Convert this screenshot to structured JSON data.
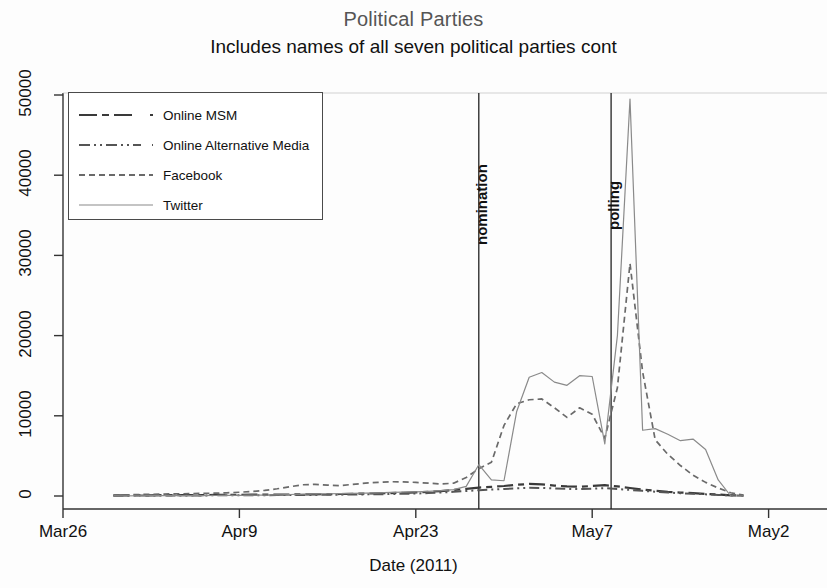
{
  "chart_data": {
    "type": "line",
    "title": "Political Parties",
    "subtitle": "Includes names of all seven political parties cont",
    "xlabel": "Date (2011)",
    "ylabel": "",
    "grid": false,
    "legend_position": "top-left",
    "xlim": [
      0,
      60
    ],
    "ylim": [
      0,
      50000
    ],
    "yticks": [
      "0",
      "10000",
      "20000",
      "30000",
      "40000",
      "50000"
    ],
    "ytick_values": [
      0,
      10000,
      20000,
      30000,
      40000,
      50000
    ],
    "xticks": [
      "Mar26",
      "Apr9",
      "Apr23",
      "May7",
      "May2"
    ],
    "xtick_values": [
      0,
      14,
      28,
      42,
      56
    ],
    "annotations": [
      {
        "label": "nomination",
        "x": 33
      },
      {
        "label": "polling",
        "x": 43.5
      }
    ],
    "x": [
      4,
      5,
      6,
      7,
      8,
      9,
      10,
      11,
      12,
      13,
      14,
      15,
      16,
      17,
      18,
      19,
      20,
      21,
      22,
      23,
      24,
      25,
      26,
      27,
      28,
      29,
      30,
      31,
      32,
      33,
      34,
      35,
      36,
      37,
      38,
      39,
      40,
      41,
      42,
      43,
      44,
      45,
      46,
      47,
      48,
      49,
      50,
      51,
      52,
      53,
      54
    ],
    "series": [
      {
        "name": "Online MSM",
        "style": "long-dash",
        "color": "#3a3a3a",
        "values": [
          60,
          70,
          80,
          90,
          100,
          110,
          110,
          120,
          130,
          140,
          150,
          160,
          170,
          180,
          190,
          200,
          210,
          230,
          250,
          270,
          300,
          330,
          360,
          400,
          450,
          520,
          620,
          760,
          900,
          1050,
          1150,
          1250,
          1400,
          1500,
          1450,
          1300,
          1200,
          1150,
          1250,
          1350,
          1200,
          1000,
          800,
          650,
          520,
          430,
          350,
          260,
          180,
          90,
          40
        ]
      },
      {
        "name": "Online Alternative Media",
        "style": "dash-dot-dot",
        "color": "#555555",
        "values": [
          40,
          45,
          50,
          55,
          60,
          65,
          70,
          75,
          80,
          85,
          90,
          95,
          100,
          110,
          120,
          130,
          140,
          155,
          170,
          185,
          200,
          220,
          245,
          275,
          310,
          360,
          430,
          520,
          620,
          720,
          800,
          880,
          960,
          1020,
          1000,
          940,
          890,
          860,
          920,
          980,
          880,
          760,
          640,
          530,
          430,
          350,
          280,
          210,
          140,
          70,
          30
        ]
      },
      {
        "name": "Facebook",
        "style": "short-dash",
        "color": "#6a6a6a",
        "values": [
          120,
          150,
          180,
          210,
          240,
          270,
          290,
          320,
          350,
          400,
          470,
          560,
          700,
          900,
          1150,
          1400,
          1450,
          1350,
          1300,
          1450,
          1600,
          1700,
          1780,
          1750,
          1700,
          1600,
          1500,
          1600,
          2300,
          3400,
          4200,
          8800,
          11500,
          12000,
          12100,
          11000,
          9800,
          11000,
          10200,
          7200,
          13500,
          29000,
          15500,
          7000,
          5200,
          3800,
          2600,
          1700,
          1000,
          400,
          100
        ]
      },
      {
        "name": "Twitter",
        "style": "solid-thin",
        "color": "#8a8a8a",
        "values": [
          20,
          25,
          30,
          35,
          40,
          45,
          50,
          55,
          60,
          70,
          85,
          100,
          120,
          150,
          190,
          230,
          260,
          280,
          300,
          330,
          360,
          400,
          440,
          480,
          520,
          580,
          660,
          800,
          1200,
          3900,
          2000,
          1900,
          10500,
          14800,
          15400,
          14200,
          13800,
          15000,
          14900,
          6500,
          20000,
          49500,
          8200,
          8400,
          7700,
          6900,
          7100,
          5800,
          2000,
          0,
          0
        ]
      }
    ]
  },
  "legend": {
    "items": [
      {
        "label": "Online MSM",
        "style": "long-dash"
      },
      {
        "label": "Online Alternative Media",
        "style": "dash-dot-dot"
      },
      {
        "label": "Facebook",
        "style": "short-dash"
      },
      {
        "label": "Twitter",
        "style": "solid-thin"
      }
    ]
  },
  "colors": {
    "background": "#fdfdfd",
    "axis": "#333333",
    "title": "#555555",
    "text": "#111111"
  }
}
